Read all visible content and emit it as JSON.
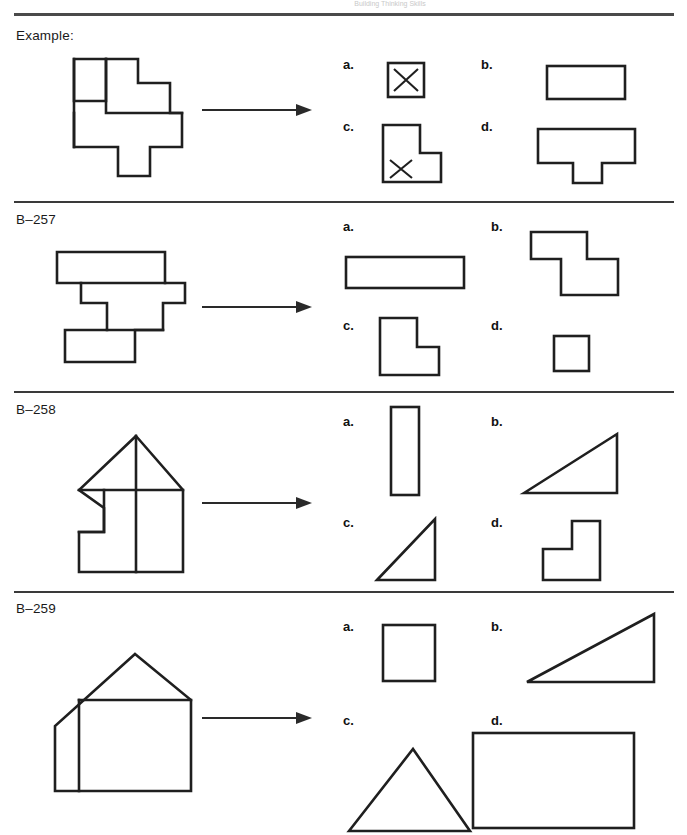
{
  "document": {
    "page_header_faint": "Building Thinking Skills",
    "background_color": "#ffffff",
    "ink_color": "#1f1f1f"
  },
  "sections": [
    {
      "id": "example",
      "label": "Example:",
      "arrow": "right-arrow",
      "prompt_shape": "irregular-polyomino-figure",
      "options": [
        {
          "key": "a.",
          "shape": "small-square-with-x"
        },
        {
          "key": "b.",
          "shape": "wide-rectangle"
        },
        {
          "key": "c.",
          "shape": "l-shape-with-x"
        },
        {
          "key": "d.",
          "shape": "t-shape"
        }
      ]
    },
    {
      "id": "b257",
      "label": "B–257",
      "arrow": "right-arrow",
      "prompt_shape": "stepped-polyomino-figure",
      "options": [
        {
          "key": "a.",
          "shape": "long-thin-rectangle"
        },
        {
          "key": "b.",
          "shape": "z-step-polyomino"
        },
        {
          "key": "c.",
          "shape": "l-shape"
        },
        {
          "key": "d.",
          "shape": "small-square"
        }
      ]
    },
    {
      "id": "b258",
      "label": "B–258",
      "arrow": "right-arrow",
      "prompt_shape": "house-with-notch-figure",
      "options": [
        {
          "key": "a.",
          "shape": "tall-narrow-rectangle"
        },
        {
          "key": "b.",
          "shape": "right-triangle-apex-top-right"
        },
        {
          "key": "c.",
          "shape": "right-triangle-apex-top-right-small"
        },
        {
          "key": "d.",
          "shape": "step-l-shape"
        }
      ]
    },
    {
      "id": "b259",
      "label": "B–259",
      "arrow": "right-arrow",
      "prompt_shape": "house-with-lean-to-figure",
      "options": [
        {
          "key": "a.",
          "shape": "square"
        },
        {
          "key": "b.",
          "shape": "right-triangle-wide"
        },
        {
          "key": "c.",
          "shape": "isoceles-triangle"
        },
        {
          "key": "d.",
          "shape": "large-rectangle"
        }
      ]
    }
  ]
}
